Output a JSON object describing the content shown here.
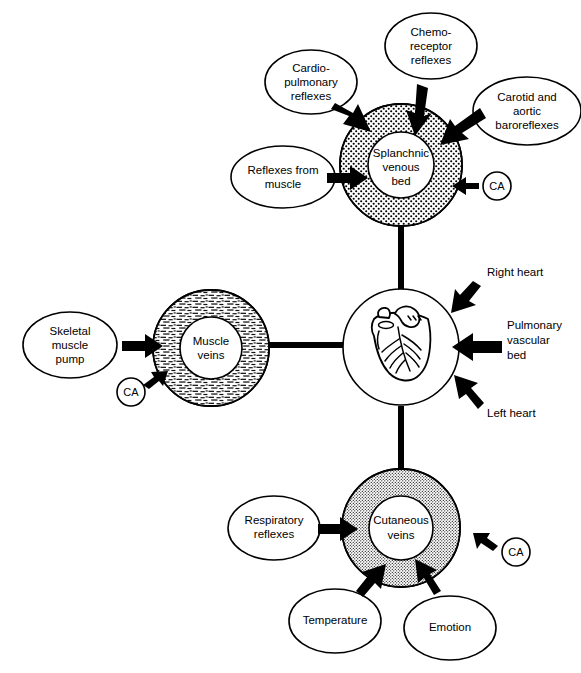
{
  "figure": {
    "background_color": "#ffffff",
    "line_color": "#000000"
  },
  "nodes": {
    "splanchnic": {
      "label_lines": [
        "Splanchnic",
        "venous",
        "bed"
      ],
      "texture": "coarse-stipple"
    },
    "muscle": {
      "label_lines": [
        "Muscle",
        "veins"
      ],
      "texture": "dash-hatch"
    },
    "cutaneous": {
      "label_lines": [
        "Cutaneous",
        "veins"
      ],
      "texture": "fine-stipple"
    },
    "heart": {
      "label_lines": [],
      "texture": "none"
    }
  },
  "influences": {
    "cardiopulmonary": {
      "lines": [
        "Cardio-",
        "pulmonary",
        "reflexes"
      ]
    },
    "chemoreceptor": {
      "lines": [
        "Chemo-",
        "receptor",
        "reflexes"
      ]
    },
    "carotid_aortic": {
      "lines": [
        "Carotid and",
        "aortic",
        "baroreflexes"
      ]
    },
    "reflexes_from_muscle": {
      "lines": [
        "Reflexes from",
        "muscle"
      ]
    },
    "skeletal_muscle_pump": {
      "lines": [
        "Skeletal",
        "muscle",
        "pump"
      ]
    },
    "respiratory": {
      "lines": [
        "Respiratory",
        "reflexes"
      ]
    },
    "temperature": {
      "lines": [
        "Temperature"
      ]
    },
    "emotion": {
      "lines": [
        "Emotion"
      ]
    }
  },
  "ca_markers": {
    "splanchnic_ca": "CA",
    "muscle_ca": "CA",
    "cutaneous_ca": "CA"
  },
  "heart_callouts": {
    "right_heart": "Right heart",
    "pulmonary": {
      "lines": [
        "Pulmonary",
        "vascular",
        "bed"
      ]
    },
    "left_heart": "Left heart"
  }
}
